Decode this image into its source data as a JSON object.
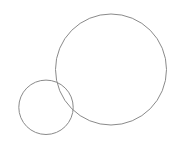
{
  "canvas": {
    "width": 180,
    "height": 149,
    "background": "#ffffff"
  },
  "style": {
    "stroke": "#8a8a8a",
    "stroke_width": 1,
    "fill": "none"
  },
  "shapes": [
    {
      "type": "circle",
      "name": "large-circle",
      "cx": 111,
      "cy": 69.5,
      "r": 55.5
    },
    {
      "type": "circle",
      "name": "small-circle",
      "cx": 46,
      "cy": 107.3,
      "r": 27.2
    }
  ]
}
